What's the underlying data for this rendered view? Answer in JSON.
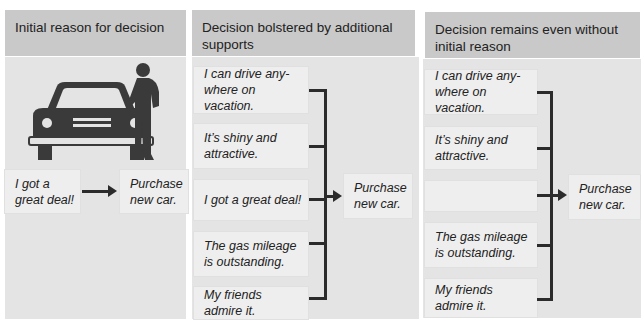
{
  "columns": [
    {
      "header": "Initial reason for decision",
      "reasons": [
        "I got a\ngreat deal!"
      ],
      "outcome": "Purchase\nnew car."
    },
    {
      "header": "Decision bolstered by additional\nsupports",
      "reasons": [
        "I can drive any-\nwhere on vacation.",
        "It’s shiny and\nattractive.",
        "I got a great deal!",
        "The gas mileage\nis outstanding.",
        "My friends\nadmire it."
      ],
      "outcome": "Purchase\nnew car."
    },
    {
      "header": "Decision remains even without\ninitial reason",
      "reasons": [
        "I can drive any-\nwhere on vacation.",
        "It’s shiny and\nattractive.",
        "",
        "The gas mileage\nis outstanding.",
        "My friends\nadmire it."
      ],
      "outcome": "Purchase\nnew car."
    }
  ],
  "illustration": {
    "icons": [
      "car-icon",
      "person-icon"
    ]
  },
  "colors": {
    "header_bg": "#c9c9c9",
    "panel_bg": "#e4e4e4",
    "box_bg": "#eeeeee",
    "line": "#2b2b2b",
    "illustration": "#3a3a3a"
  }
}
